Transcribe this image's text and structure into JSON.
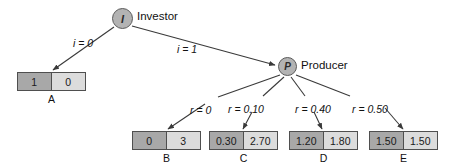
{
  "diagram": {
    "nodes": [
      {
        "id": "investor",
        "glyph": "I",
        "label": "Investor"
      },
      {
        "id": "producer",
        "glyph": "P",
        "label": "Producer"
      }
    ],
    "edges": [
      {
        "from": "investor",
        "to": "A",
        "label": "i = 0"
      },
      {
        "from": "investor",
        "to": "producer",
        "label": "i = 1"
      },
      {
        "from": "producer",
        "to": "B",
        "label": "r = 0"
      },
      {
        "from": "producer",
        "to": "C",
        "label": "r = 0.10"
      },
      {
        "from": "producer",
        "to": "D",
        "label": "r = 0.40"
      },
      {
        "from": "producer",
        "to": "E",
        "label": "r = 0.50"
      }
    ],
    "outcomes": [
      {
        "id": "A",
        "name": "A",
        "left": "1",
        "right": "0"
      },
      {
        "id": "B",
        "name": "B",
        "left": "0",
        "right": "3"
      },
      {
        "id": "C",
        "name": "C",
        "left": "0.30",
        "right": "2.70"
      },
      {
        "id": "D",
        "name": "D",
        "left": "1.20",
        "right": "1.80"
      },
      {
        "id": "E",
        "name": "E",
        "left": "1.50",
        "right": "1.50"
      }
    ],
    "colors": {
      "node_fill": "#b3b3b3",
      "node_stroke": "#5a5a5a",
      "cell_left_fill": "#a8a8a8",
      "cell_right_fill": "#dcdcdc",
      "box_stroke": "#4f4f4f",
      "edge_stroke": "#3a3a3a",
      "background": "#ffffff"
    }
  }
}
